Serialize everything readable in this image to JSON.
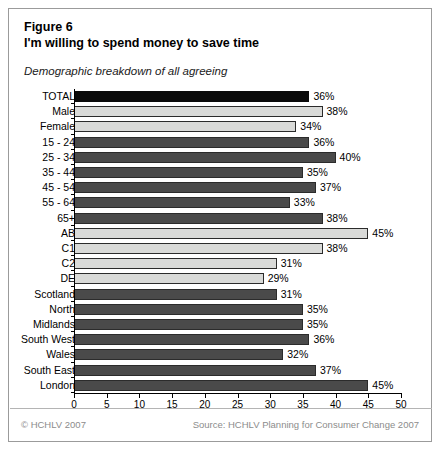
{
  "figure": {
    "title_line1": "Figure 6",
    "title_line2": "I'm willing to spend money to save time",
    "subtitle": "Demographic breakdown of all agreeing"
  },
  "footer": {
    "copyright": "© HCHLV 2007",
    "source": "Source: HCHLV Planning for Consumer Change 2007"
  },
  "colors": {
    "black": "#0a0a0a",
    "dark_gray": "#4a4a4a",
    "light_gray": "#d9dad8",
    "border": "#9b9b9b",
    "footer_text": "#8c8c8c"
  },
  "chart_data": {
    "type": "bar",
    "orientation": "horizontal",
    "title": "I'm willing to spend money to save time",
    "subtitle": "Demographic breakdown of all agreeing",
    "xlabel": "",
    "ylabel": "",
    "xlim": [
      0,
      50
    ],
    "xticks": [
      0,
      5,
      10,
      15,
      20,
      25,
      30,
      35,
      40,
      45,
      50
    ],
    "tick_labels": [
      "0",
      "5",
      "10",
      "15",
      "20",
      "25",
      "30",
      "35",
      "40",
      "45",
      "50"
    ],
    "grid": false,
    "legend": "none",
    "value_suffix": "%",
    "categories": [
      "TOTAL",
      "Male",
      "Female",
      "15 - 24",
      "25 - 34",
      "35 - 44",
      "45 - 54",
      "55 - 64",
      "65+",
      "AB",
      "C1",
      "C2",
      "DE",
      "Scotland",
      "North",
      "Midlands",
      "South West",
      "Wales",
      "South East",
      "London"
    ],
    "values": [
      36,
      38,
      34,
      36,
      40,
      35,
      37,
      33,
      38,
      45,
      38,
      31,
      29,
      31,
      35,
      35,
      36,
      32,
      37,
      45
    ],
    "bars": [
      {
        "label": "TOTAL",
        "value": 36,
        "value_label": "36%",
        "shade": "black"
      },
      {
        "label": "Male",
        "value": 38,
        "value_label": "38%",
        "shade": "light"
      },
      {
        "label": "Female",
        "value": 34,
        "value_label": "34%",
        "shade": "light"
      },
      {
        "label": "15 - 24",
        "value": 36,
        "value_label": "36%",
        "shade": "dark"
      },
      {
        "label": "25 - 34",
        "value": 40,
        "value_label": "40%",
        "shade": "dark"
      },
      {
        "label": "35 - 44",
        "value": 35,
        "value_label": "35%",
        "shade": "dark"
      },
      {
        "label": "45 - 54",
        "value": 37,
        "value_label": "37%",
        "shade": "dark"
      },
      {
        "label": "55 - 64",
        "value": 33,
        "value_label": "33%",
        "shade": "dark"
      },
      {
        "label": "65+",
        "value": 38,
        "value_label": "38%",
        "shade": "dark"
      },
      {
        "label": "AB",
        "value": 45,
        "value_label": "45%",
        "shade": "light"
      },
      {
        "label": "C1",
        "value": 38,
        "value_label": "38%",
        "shade": "light"
      },
      {
        "label": "C2",
        "value": 31,
        "value_label": "31%",
        "shade": "light"
      },
      {
        "label": "DE",
        "value": 29,
        "value_label": "29%",
        "shade": "light"
      },
      {
        "label": "Scotland",
        "value": 31,
        "value_label": "31%",
        "shade": "dark"
      },
      {
        "label": "North",
        "value": 35,
        "value_label": "35%",
        "shade": "dark"
      },
      {
        "label": "Midlands",
        "value": 35,
        "value_label": "35%",
        "shade": "dark"
      },
      {
        "label": "South West",
        "value": 36,
        "value_label": "36%",
        "shade": "dark"
      },
      {
        "label": "Wales",
        "value": 32,
        "value_label": "32%",
        "shade": "dark"
      },
      {
        "label": "South East",
        "value": 37,
        "value_label": "37%",
        "shade": "dark"
      },
      {
        "label": "London",
        "value": 45,
        "value_label": "45%",
        "shade": "dark"
      }
    ]
  }
}
